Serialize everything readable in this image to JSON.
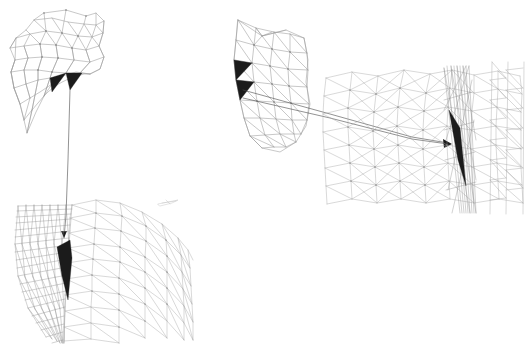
{
  "figure": {
    "background_color": "#ffffff",
    "width": 528,
    "height": 344,
    "edge_color": "#9a9a9a",
    "node_color": "#6f6f6f",
    "sliver_color": "#1b1b1b",
    "leader_color": "#4a4a4a",
    "ghost_color": "#c2c2c2"
  },
  "panels": [
    {
      "id": "panel-top-left-coarse",
      "label": "top-left coarse mesh patch",
      "role": "coarse-overview",
      "bounds": [
        10,
        8,
        100,
        130
      ],
      "sliver_count": 2,
      "sliver_labels": [
        "sliver-triangle-a",
        "sliver-triangle-b"
      ]
    },
    {
      "id": "panel-bottom-left-dense",
      "label": "bottom-left magnified dense mesh",
      "role": "magnified-detail",
      "bounds": [
        10,
        196,
        190,
        148
      ],
      "sliver_count": 1,
      "sliver_labels": [
        "sliver-triangle-c"
      ]
    },
    {
      "id": "panel-middle-coarse",
      "label": "middle coarse mesh patch",
      "role": "coarse-overview",
      "bounds": [
        230,
        8,
        90,
        155
      ],
      "sliver_count": 2,
      "sliver_labels": [
        "sliver-triangle-d",
        "sliver-triangle-e"
      ]
    },
    {
      "id": "panel-right-dense",
      "label": "right magnified dense mesh",
      "role": "magnified-detail",
      "bounds": [
        322,
        62,
        206,
        152
      ],
      "sliver_count": 1,
      "sliver_labels": [
        "sliver-triangle-f"
      ]
    }
  ],
  "callouts": [
    {
      "id": "callout-left",
      "label": "left zoom leader line",
      "from_panel": "panel-top-left-coarse",
      "to_panel": "panel-bottom-left-dense",
      "orientation": "vertical",
      "has_arrowhead": true
    },
    {
      "id": "callout-right",
      "label": "right zoom leader lines",
      "from_panel": "panel-middle-coarse",
      "to_panel": "panel-right-dense",
      "orientation": "horizontal",
      "has_arrowhead": true
    }
  ],
  "annotations": {
    "ghost_fragment_label": "detached mesh sliver fragment",
    "caption": ""
  }
}
